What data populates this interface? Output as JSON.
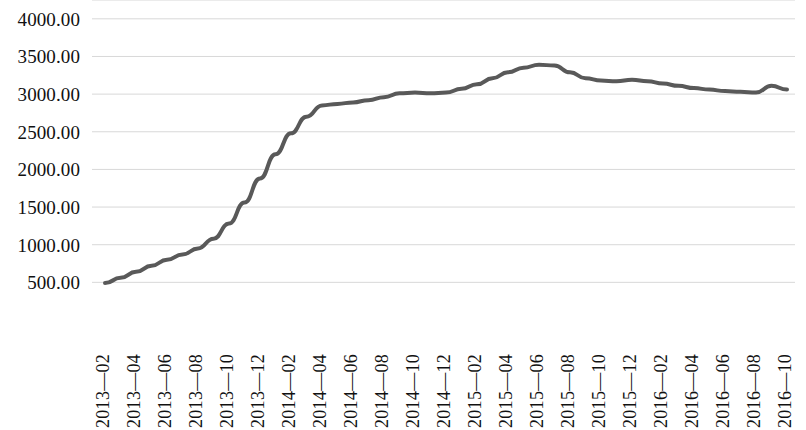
{
  "chart_data": {
    "type": "line",
    "title": "",
    "subtitle": "",
    "xlabel": "",
    "ylabel": "",
    "grid": true,
    "legend": null,
    "legend_position": "none",
    "ylim": [
      0,
      4250
    ],
    "y_ticks": [
      4000,
      3500,
      3000,
      2500,
      2000,
      1500,
      1000,
      500
    ],
    "y_tick_labels": [
      "4000.00",
      "3500.00",
      "3000.00",
      "2500.00",
      "2000.00",
      "1500.00",
      "1000.00",
      "500.00"
    ],
    "x_tick_labels": [
      "2013—02",
      "2013—04",
      "2013—06",
      "2013—08",
      "2013—10",
      "2013—12",
      "2014—02",
      "2014—04",
      "2014—06",
      "2014—08",
      "2014—10",
      "2014—12",
      "2015—02",
      "2015—04",
      "2015—06",
      "2015—08",
      "2015—10",
      "2015—12",
      "2016—02",
      "2016—04",
      "2016—06",
      "2016—08",
      "2016—10"
    ],
    "line_color": "#595959",
    "line_width": 4,
    "x": [
      "2013—02",
      "2013—03",
      "2013—04",
      "2013—05",
      "2013—06",
      "2013—07",
      "2013—08",
      "2013—09",
      "2013—10",
      "2013—11",
      "2013—12",
      "2014—01",
      "2014—02",
      "2014—03",
      "2014—04",
      "2014—05",
      "2014—06",
      "2014—07",
      "2014—08",
      "2014—09",
      "2014—10",
      "2014—11",
      "2014—12",
      "2015—01",
      "2015—02",
      "2015—03",
      "2015—04",
      "2015—05",
      "2015—06",
      "2015—07",
      "2015—08",
      "2015—09",
      "2015—10",
      "2015—11",
      "2015—12",
      "2016—01",
      "2016—02",
      "2016—03",
      "2016—04",
      "2016—05",
      "2016—06",
      "2016—07",
      "2016—08",
      "2016—09",
      "2016—10"
    ],
    "values": [
      490,
      560,
      640,
      720,
      800,
      870,
      950,
      1080,
      1280,
      1560,
      1880,
      2200,
      2480,
      2700,
      2850,
      2870,
      2890,
      2920,
      2960,
      3010,
      3020,
      3010,
      3020,
      3070,
      3130,
      3210,
      3290,
      3350,
      3390,
      3380,
      3290,
      3210,
      3180,
      3170,
      3190,
      3170,
      3140,
      3110,
      3080,
      3060,
      3040,
      3030,
      3020,
      3110,
      3060
    ],
    "series_name": ""
  }
}
